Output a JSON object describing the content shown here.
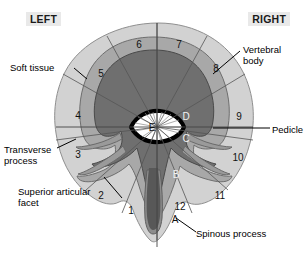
{
  "figure": {
    "orientation": {
      "left_label": "LEFT",
      "right_label": "RIGHT"
    }
  },
  "callouts": [
    {
      "id": "soft-tissue",
      "text": "Soft tissue",
      "side": "left"
    },
    {
      "id": "transverse-process",
      "text": "Transverse\nprocess",
      "side": "left"
    },
    {
      "id": "superior-articular-facet",
      "text": "Superior articular\nfacet",
      "side": "left"
    },
    {
      "id": "vertebral-body",
      "text": "Vertebral\nbody",
      "side": "right"
    },
    {
      "id": "pedicle",
      "text": "Pedicle",
      "side": "right"
    },
    {
      "id": "spinous-process",
      "text": "Spinous process",
      "side": "bottom"
    }
  ],
  "clock_sectors": [
    {
      "label": "1",
      "x": 131,
      "y": 211
    },
    {
      "label": "2",
      "x": 101,
      "y": 196
    },
    {
      "label": "3",
      "x": 78,
      "y": 155
    },
    {
      "label": "4",
      "x": 78,
      "y": 116
    },
    {
      "label": "5",
      "x": 101,
      "y": 74
    },
    {
      "label": "6",
      "x": 139,
      "y": 45
    },
    {
      "label": "7",
      "x": 179,
      "y": 45
    },
    {
      "label": "8",
      "x": 216,
      "y": 69
    },
    {
      "label": "9",
      "x": 239,
      "y": 117
    },
    {
      "label": "10",
      "x": 238,
      "y": 158
    },
    {
      "label": "11",
      "x": 220,
      "y": 196
    },
    {
      "label": "12",
      "x": 180,
      "y": 207
    }
  ],
  "depth_zones": [
    {
      "label": "A",
      "x": 175,
      "y": 220,
      "tone": "dark"
    },
    {
      "label": "B",
      "x": 176,
      "y": 175,
      "tone": "light"
    },
    {
      "label": "C",
      "x": 186,
      "y": 139,
      "tone": "light"
    },
    {
      "label": "D",
      "x": 186,
      "y": 117,
      "tone": "light"
    },
    {
      "label": "E",
      "x": 152,
      "y": 128,
      "tone": "ink"
    }
  ],
  "colors": {
    "soft_tissue": "#d2d2d2",
    "vertebral_body_outer": "#a8a8a8",
    "vertebral_body_inner": "#6f6f6f",
    "posterior_elements": "#4f4f4f",
    "canal_outline": "#000000",
    "canal_fill": "#ffffff",
    "background": "#ffffff",
    "label_chip": "#e9e9e9"
  }
}
